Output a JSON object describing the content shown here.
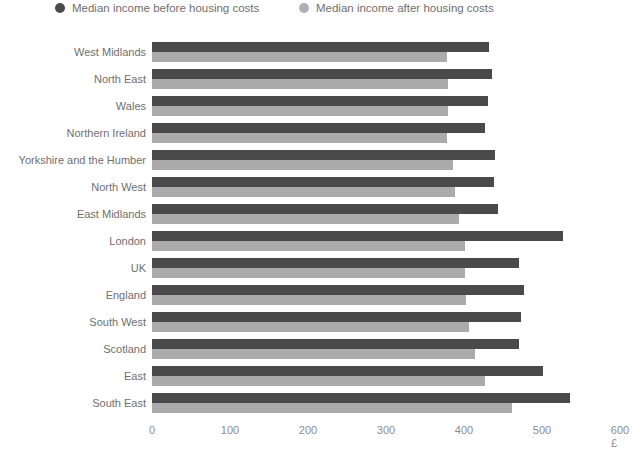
{
  "legend": {
    "items": [
      {
        "label": "Median income before housing costs",
        "color": "#4a4a4a",
        "key": "before"
      },
      {
        "label": "Median income after housing costs",
        "color": "#ababab",
        "key": "after"
      }
    ]
  },
  "axis": {
    "unit_label": "£",
    "ticks": [
      "0",
      "100",
      "200",
      "300",
      "400",
      "500",
      "600"
    ]
  },
  "chart_data": {
    "type": "bar",
    "orientation": "horizontal",
    "title": "",
    "subtitle": "",
    "xlabel": "£",
    "ylabel": "",
    "xlim": [
      0,
      600
    ],
    "xticks": [
      0,
      100,
      200,
      300,
      400,
      500,
      600
    ],
    "grid": false,
    "legend_position": "top",
    "categories": [
      "West Midlands",
      "North East",
      "Wales",
      "Northern Ireland",
      "Yorkshire and the Humber",
      "North West",
      "East Midlands",
      "London",
      "UK",
      "England",
      "South West",
      "Scotland",
      "East",
      "South East"
    ],
    "series": [
      {
        "name": "Median income before housing costs",
        "color": "#4a4a4a",
        "values": [
          432,
          436,
          431,
          427,
          440,
          438,
          443,
          527,
          470,
          477,
          473,
          470,
          501,
          536
        ]
      },
      {
        "name": "Median income after housing costs",
        "color": "#ababab",
        "values": [
          378,
          380,
          379,
          378,
          386,
          388,
          393,
          401,
          401,
          403,
          407,
          414,
          427,
          462
        ]
      }
    ]
  }
}
